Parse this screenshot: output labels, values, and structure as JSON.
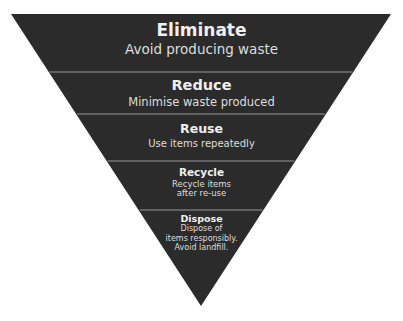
{
  "diagram": {
    "type": "inverted-pyramid",
    "colors": {
      "fill": "#2b2b2b",
      "divider": "#9a9a9a",
      "text": "#ececec",
      "background": "#ffffff"
    },
    "shape": {
      "top_left": [
        11,
        14
      ],
      "top_right": [
        391,
        14
      ],
      "apex": [
        201,
        306
      ]
    },
    "divider_y": [
      72,
      114,
      161,
      210
    ],
    "tiers": [
      {
        "title": "Eliminate",
        "lines": [
          "Avoid producing waste"
        ]
      },
      {
        "title": "Reduce",
        "lines": [
          "Minimise waste produced"
        ]
      },
      {
        "title": "Reuse",
        "lines": [
          "Use items repeatedly"
        ]
      },
      {
        "title": "Recycle",
        "lines": [
          "Recycle items",
          "after re-use"
        ]
      },
      {
        "title": "Dispose",
        "lines": [
          "Dispose of",
          "items responsibly.",
          "Avoid landfill."
        ]
      }
    ]
  }
}
